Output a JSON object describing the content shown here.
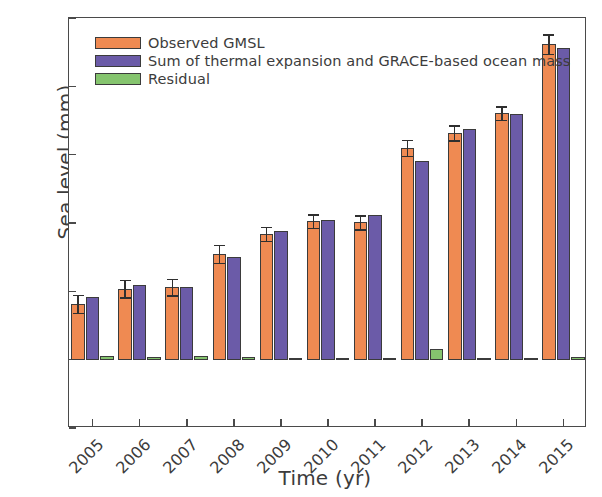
{
  "chart_data": {
    "type": "bar",
    "title": "",
    "xlabel": "Time (yr)",
    "ylabel": "Sea level (mm)",
    "categories": [
      "2005",
      "2006",
      "2007",
      "2008",
      "2009",
      "2010",
      "2011",
      "2012",
      "2013",
      "2014",
      "2015"
    ],
    "ylim": [
      -10,
      50
    ],
    "yticks": [
      -10,
      0,
      10,
      20,
      30,
      40,
      50
    ],
    "grid": false,
    "legend_position": "upper left",
    "series": [
      {
        "name": "Observed GMSL",
        "color": "#ef8a52",
        "values": [
          8.2,
          10.4,
          10.6,
          15.5,
          18.4,
          20.3,
          20.1,
          31.0,
          33.2,
          36.1,
          46.2
        ],
        "errors": [
          1.3,
          1.3,
          1.2,
          1.3,
          1.0,
          1.0,
          1.0,
          1.2,
          1.1,
          1.0,
          1.4
        ]
      },
      {
        "name": "Sum of thermal expansion and GRACE-based ocean mass",
        "color": "#6b5ba8",
        "values": [
          9.1,
          10.9,
          10.7,
          15.0,
          18.8,
          20.5,
          21.1,
          29.1,
          33.8,
          36.0,
          45.6
        ],
        "errors": [
          0,
          0,
          0,
          0,
          0,
          0,
          0,
          0,
          0,
          0,
          0
        ]
      },
      {
        "name": "Residual",
        "color": "#85c46e",
        "values": [
          0.5,
          0.4,
          0.5,
          0.4,
          0.2,
          0.2,
          0.3,
          1.5,
          0.3,
          0.3,
          0.4
        ],
        "errors": [
          0,
          0,
          0,
          0,
          0,
          0,
          0,
          0,
          0,
          0,
          0
        ]
      }
    ]
  },
  "legend": {
    "items": [
      {
        "label": "Observed GMSL",
        "swatch": "observed"
      },
      {
        "label": "Sum of thermal expansion and GRACE-based ocean mass",
        "swatch": "sum"
      },
      {
        "label": "Residual",
        "swatch": "residual"
      }
    ]
  }
}
